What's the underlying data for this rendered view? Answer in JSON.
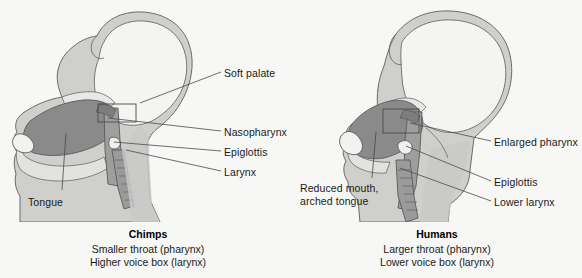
{
  "figure": {
    "type": "anatomical-comparison-diagram",
    "background_color": "#f7f7f5",
    "stroke_color": "#555555",
    "fills": {
      "head_outline": "#cfcfcb",
      "head_interior": "#f2f2f0",
      "neck": "#c9c9c9",
      "tongue": "#8a8a8a",
      "airway": "#a8a8a8"
    }
  },
  "panels": [
    {
      "id": "chimp",
      "title": "Chimps",
      "subtitle_lines": [
        "Smaller throat (pharynx)",
        "Higher voice box (larynx)"
      ],
      "labels": [
        {
          "id": "soft-palate",
          "text": "Soft palate",
          "x": 224,
          "y": 67,
          "line": {
            "x1": 221,
            "y1": 72,
            "x2": 140,
            "y2": 103
          }
        },
        {
          "id": "nasopharynx",
          "text": "Nasopharynx",
          "x": 224,
          "y": 126,
          "line": {
            "x1": 221,
            "y1": 131,
            "x2": 108,
            "y2": 118
          }
        },
        {
          "id": "epiglottis",
          "text": "Epiglottis",
          "x": 224,
          "y": 146,
          "line": {
            "x1": 221,
            "y1": 151,
            "x2": 114,
            "y2": 142
          }
        },
        {
          "id": "larynx",
          "text": "Larynx",
          "x": 224,
          "y": 166,
          "line": {
            "x1": 221,
            "y1": 171,
            "x2": 126,
            "y2": 150
          }
        },
        {
          "id": "tongue",
          "text": "Tongue",
          "x": 28,
          "y": 196,
          "line": {
            "x1": 62,
            "y1": 193,
            "x2": 64,
            "y2": 135
          }
        }
      ]
    },
    {
      "id": "human",
      "title": "Humans",
      "subtitle_lines": [
        "Larger throat (pharynx)",
        "Lower voice box (larynx)"
      ],
      "labels": [
        {
          "id": "enlarged-pharynx",
          "text": "Enlarged pharynx",
          "x": 494,
          "y": 136,
          "line": {
            "x1": 491,
            "y1": 141,
            "x2": 408,
            "y2": 124
          }
        },
        {
          "id": "epiglottis",
          "text": "Epiglottis",
          "x": 494,
          "y": 176,
          "line": {
            "x1": 491,
            "y1": 181,
            "x2": 404,
            "y2": 144
          }
        },
        {
          "id": "lower-larynx",
          "text": "Lower larynx",
          "x": 494,
          "y": 196,
          "line": {
            "x1": 491,
            "y1": 201,
            "x2": 400,
            "y2": 167
          }
        },
        {
          "id": "reduced-mouth",
          "text": "Reduced mouth,",
          "x": 300,
          "y": 182,
          "line": {
            "x1": 372,
            "y1": 178,
            "x2": 374,
            "y2": 134
          }
        },
        {
          "id": "arched-tongue",
          "text": "arched tongue",
          "x": 300,
          "y": 195,
          "line": null
        }
      ]
    }
  ],
  "captions": {
    "chimp": {
      "title_x": 148,
      "title_y": 228,
      "sub_x": 148,
      "sub_y": 243
    },
    "human": {
      "title_x": 437,
      "title_y": 228,
      "sub_x": 437,
      "sub_y": 243
    }
  }
}
